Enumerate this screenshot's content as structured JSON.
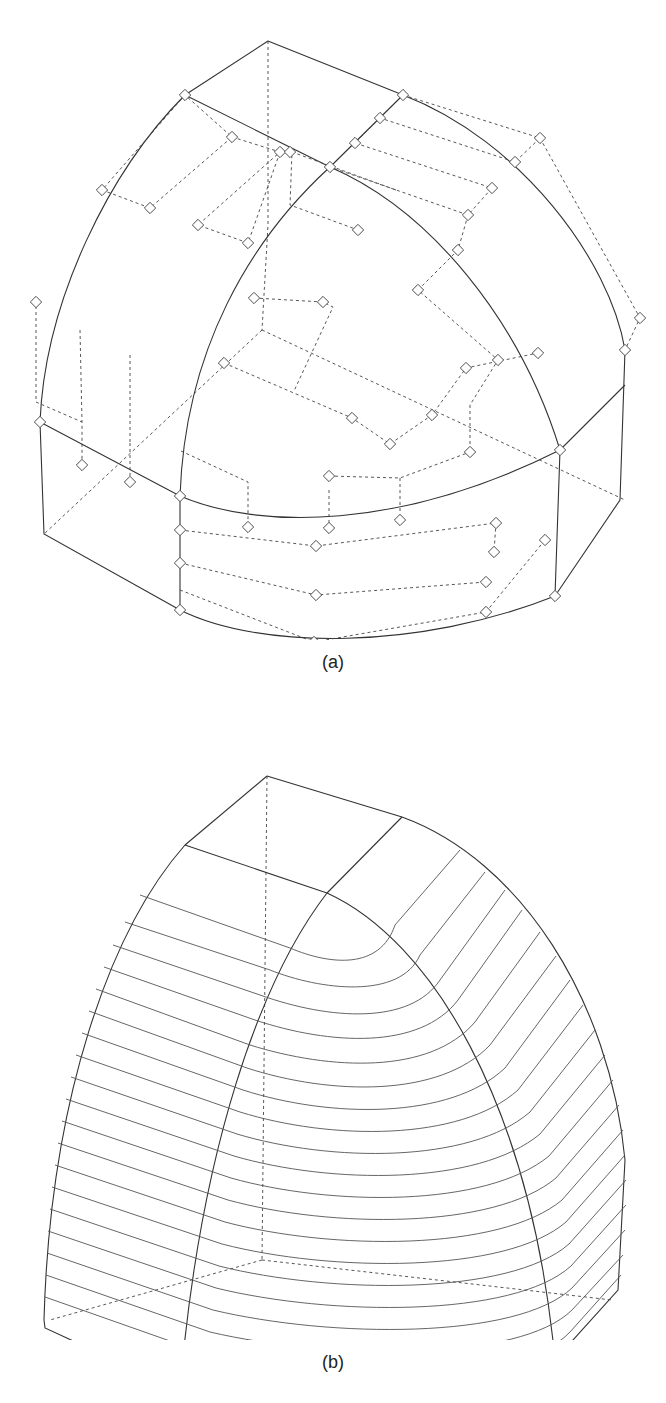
{
  "figure": {
    "panels": [
      {
        "label": "(a)",
        "description": "Wireframe surface patch with dashed control-point net and diamond control-point markers"
      },
      {
        "label": "(b)",
        "description": "Same surface rendered with iso-parametric contour lines"
      }
    ],
    "colors": {
      "line": "#333333",
      "dashed": "#444444",
      "background": "#ffffff"
    }
  }
}
